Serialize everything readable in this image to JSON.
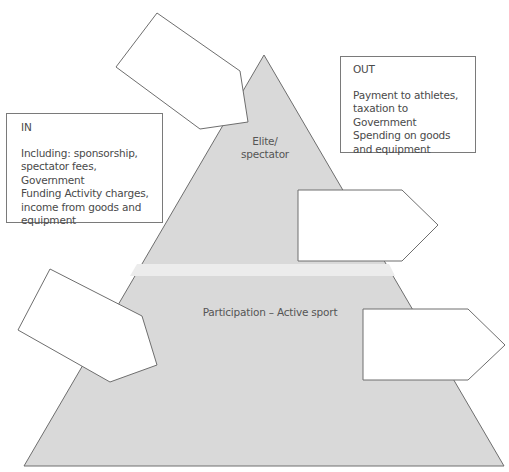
{
  "diagram": {
    "type": "pyramid-flow-diagram",
    "colors": {
      "pyramid_fill": "#d9d9d9",
      "pyramid_stroke": "#6e6e6e",
      "tier_divider": "#ececec",
      "box_fill": "#ffffff",
      "box_stroke": "#7a7a7a",
      "text": "#4a4a4a"
    },
    "pyramid": {
      "tiers": [
        {
          "id": "elite",
          "label": "Elite/\nspectator"
        },
        {
          "id": "participation",
          "label": "Participation – Active sport"
        }
      ]
    },
    "in_box": {
      "title": "IN",
      "body": "Including: sponsorship,\nspectator fees, Government\nFunding Activity charges,\nincome from goods and\nequipment"
    },
    "out_box": {
      "title": "OUT",
      "body": "Payment to athletes,\ntaxation to Government\nSpending on goods\nand equipment"
    },
    "arrow_boxes": [
      {
        "id": "top-left-arrow",
        "direction": "into-pyramid",
        "text": ""
      },
      {
        "id": "middle-right-arrow",
        "direction": "out-of-pyramid",
        "text": ""
      },
      {
        "id": "lower-left-arrow",
        "direction": "into-pyramid",
        "text": ""
      },
      {
        "id": "lower-right-arrow",
        "direction": "out-of-pyramid",
        "text": ""
      }
    ]
  }
}
